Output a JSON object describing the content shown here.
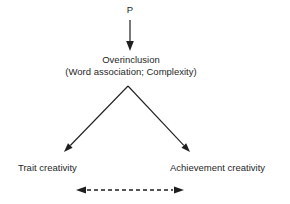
{
  "colors": {
    "background": "#ffffff",
    "ink": "#1f1f1f"
  },
  "diagram": {
    "nodes": {
      "predictor": {
        "label": "P"
      },
      "overinclusion": {
        "label": "Overinclusion",
        "sublabel": "(Word association; Complexity)"
      },
      "trait_creativity": {
        "label": "Trait creativity"
      },
      "achievement_creativity": {
        "label": "Achievement creativity"
      }
    },
    "edges": [
      {
        "from": "P",
        "to": "Overinclusion",
        "style": "solid",
        "arrow": "single-down"
      },
      {
        "from": "Overinclusion",
        "to": "Trait creativity",
        "style": "solid",
        "arrow": "single"
      },
      {
        "from": "Overinclusion",
        "to": "Achievement creativity",
        "style": "solid",
        "arrow": "single"
      },
      {
        "from": "Trait creativity",
        "to": "Achievement creativity",
        "style": "dashed",
        "arrow": "double"
      }
    ]
  }
}
